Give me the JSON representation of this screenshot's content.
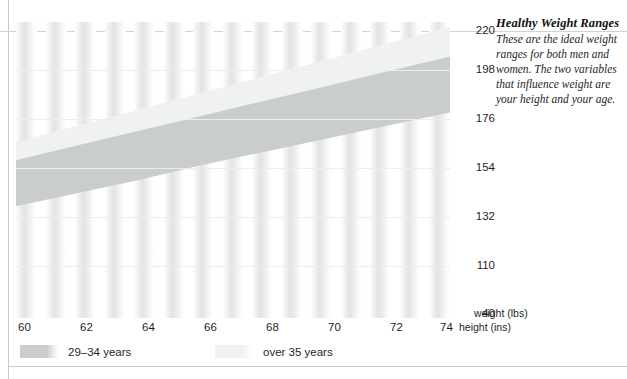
{
  "note": {
    "title": "Healthy Weight Ranges",
    "body": "These are the ideal weight ranges for both men and women. The two variables that influence weight are your height and your age."
  },
  "axes": {
    "y_title": "weight (lbs)",
    "x_title": "height (ins)",
    "y_ticks": [
      "220",
      "198",
      "176",
      "154",
      "132",
      "110",
      "40"
    ],
    "x_ticks": [
      "60",
      "62",
      "64",
      "66",
      "68",
      "70",
      "72",
      "74"
    ]
  },
  "legend": {
    "items": [
      {
        "label": "29–34 years",
        "color": "#c9cecd"
      },
      {
        "label": "over 35 years",
        "color": "#f0f2f1"
      }
    ]
  },
  "chart_data": {
    "type": "area",
    "title": "Healthy Weight Ranges",
    "xlabel": "height (ins)",
    "ylabel": "weight (lbs)",
    "xlim": [
      60,
      74
    ],
    "ylim": [
      40,
      220
    ],
    "ytick_values": [
      40,
      110,
      132,
      154,
      176,
      198,
      220
    ],
    "xtick_values": [
      60,
      62,
      64,
      66,
      68,
      70,
      72,
      74
    ],
    "grid": true,
    "legend_position": "bottom",
    "x": [
      60,
      62,
      64,
      66,
      68,
      70,
      72,
      74
    ],
    "series": [
      {
        "name": "29–34 years",
        "type": "band",
        "color": "#c9cecd",
        "lower": [
          108,
          116,
          124,
          133,
          141,
          149,
          157,
          165
        ],
        "upper": [
          136,
          145,
          154,
          163,
          172,
          181,
          190,
          199
        ]
      },
      {
        "name": "over 35 years",
        "type": "band",
        "color": "#f0f2f1",
        "lower": [
          118,
          127,
          136,
          145,
          154,
          163,
          172,
          181
        ],
        "upper": [
          147,
          157,
          167,
          177,
          187,
          197,
          207,
          217
        ]
      }
    ]
  }
}
